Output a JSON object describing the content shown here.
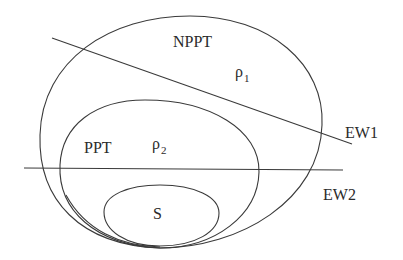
{
  "diagram": {
    "regions": {
      "outer": {
        "label": "NPPT",
        "state": "ρ",
        "state_sub": "1"
      },
      "middle": {
        "label": "PPT",
        "state": "ρ",
        "state_sub": "2"
      },
      "inner": {
        "label": "S"
      }
    },
    "witnesses": [
      {
        "label": "EW1"
      },
      {
        "label": "EW2"
      }
    ],
    "stroke_color": "#3a3a3a",
    "background": "#ffffff"
  }
}
